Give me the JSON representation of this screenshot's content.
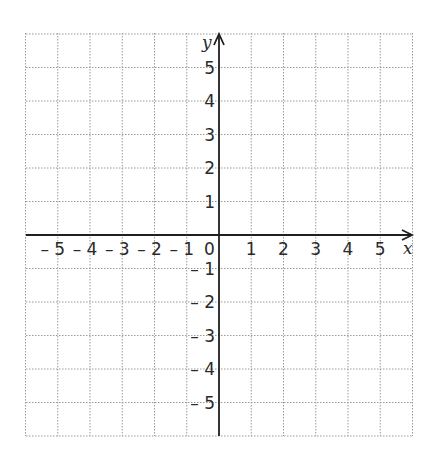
{
  "diagram": {
    "type": "cartesian-coordinate-grid",
    "x_axis_label": "x",
    "y_axis_label": "y",
    "origin_label": "0",
    "x_range": [
      -6,
      6
    ],
    "y_range": [
      -6,
      6
    ],
    "x_tick_labels": [
      "-5",
      "-4",
      "-3",
      "-2",
      "-1",
      "1",
      "2",
      "3",
      "4",
      "5"
    ],
    "y_tick_labels": [
      "5",
      "4",
      "3",
      "2",
      "1",
      "-1",
      "-2",
      "-3",
      "-4",
      "-5"
    ],
    "grid": {
      "style": "dotted",
      "spacing": 1,
      "color": "#9a9a9a"
    },
    "axis_color": "#1f1f1f"
  },
  "layout": {
    "left": 26,
    "top": 33,
    "right": 413,
    "bottom": 436,
    "origin_x": 219,
    "origin_y": 235,
    "unit_x": 32.25,
    "unit_y": 33.5
  }
}
